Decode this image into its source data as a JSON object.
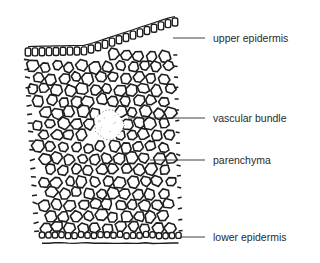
{
  "diagram": {
    "colors": {
      "ink": "#1e1e1e",
      "background": "#ffffff",
      "label_text": "#2a2a2a"
    },
    "labels": [
      {
        "id": "upper-epidermis",
        "text": "upper epidermis",
        "line": [
          173,
          38,
          205,
          38
        ],
        "text_pos": [
          213,
          32
        ]
      },
      {
        "id": "vascular-bundle",
        "text": "vascular bundle",
        "line": [
          128,
          118,
          205,
          118
        ],
        "text_pos": [
          213,
          112
        ]
      },
      {
        "id": "parenchyma",
        "text": "parenchyma",
        "line": [
          150,
          160,
          205,
          160
        ],
        "text_pos": [
          213,
          154
        ]
      },
      {
        "id": "lower-epidermis",
        "text": "lower epidermis",
        "line": [
          180,
          237,
          205,
          237
        ],
        "text_pos": [
          213,
          231
        ]
      }
    ]
  }
}
